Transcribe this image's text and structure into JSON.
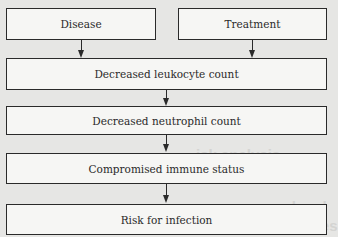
{
  "diagram": {
    "type": "flowchart",
    "nodes": [
      {
        "id": "disease",
        "label": "Disease"
      },
      {
        "id": "treatment",
        "label": "Treatment"
      },
      {
        "id": "leukocyte",
        "label": "Decreased leukocyte count"
      },
      {
        "id": "neutrophil",
        "label": "Decreased neutrophil count"
      },
      {
        "id": "immune",
        "label": "Compromised immune status"
      },
      {
        "id": "infection",
        "label": "Risk for infection"
      }
    ],
    "edges": [
      {
        "from": "disease",
        "to": "leukocyte"
      },
      {
        "from": "treatment",
        "to": "leukocyte"
      },
      {
        "from": "leukocyte",
        "to": "neutrophil"
      },
      {
        "from": "neutrophil",
        "to": "immune"
      },
      {
        "from": "immune",
        "to": "infection"
      }
    ]
  },
  "colors": {
    "background": "#e6e6e4",
    "box_fill": "#f6f6f4",
    "stroke": "#2a2a2a"
  }
}
